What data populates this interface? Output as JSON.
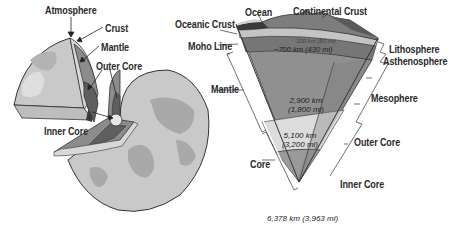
{
  "globe": {
    "labels": {
      "atmosphere": "Atmosphere",
      "crust": "Crust",
      "mantle": "Mantle",
      "outer_core": "Outer Core",
      "inner_core": "Inner Core"
    }
  },
  "cross_section": {
    "labels": {
      "ocean": "Ocean",
      "continental_crust": "Continental Crust",
      "oceanic_crust": "Oceanic Crust",
      "moho_line": "Moho Line",
      "mantle": "Mantle",
      "core": "Core",
      "lithosphere": "Lithosphere",
      "asthenosphere": "Asthenosphere",
      "mesosphere": "Mesophere",
      "outer_core": "Outer Core",
      "inner_core": "Inner Core"
    },
    "measurements": {
      "lithosphere_depth": "100 km (60 mi)",
      "asthenosphere_depth": "~700 km (430 mi)",
      "mantle_depth_km": "2,900 km",
      "mantle_depth_mi": "(1,800 mi)",
      "outer_core_depth_km": "5,100 km",
      "outer_core_depth_mi": "(3,200 mi)",
      "center_depth": "6,378 km (3,963 mi)"
    }
  },
  "colors": {
    "globe_surface": "#c9c9c9",
    "land": "#a9a9a9",
    "crust": "#d8d8d8",
    "mantle": "#8c8c8c",
    "outer_core": "#5f5f5f",
    "inner_core": "#e6e6e6",
    "lithosphere": "#c4c4c4",
    "asthenosphere": "#767676",
    "mesosphere": "#909090",
    "outer_core_section": "#dcdcdc",
    "inner_core_section": "#9a9a9a"
  }
}
